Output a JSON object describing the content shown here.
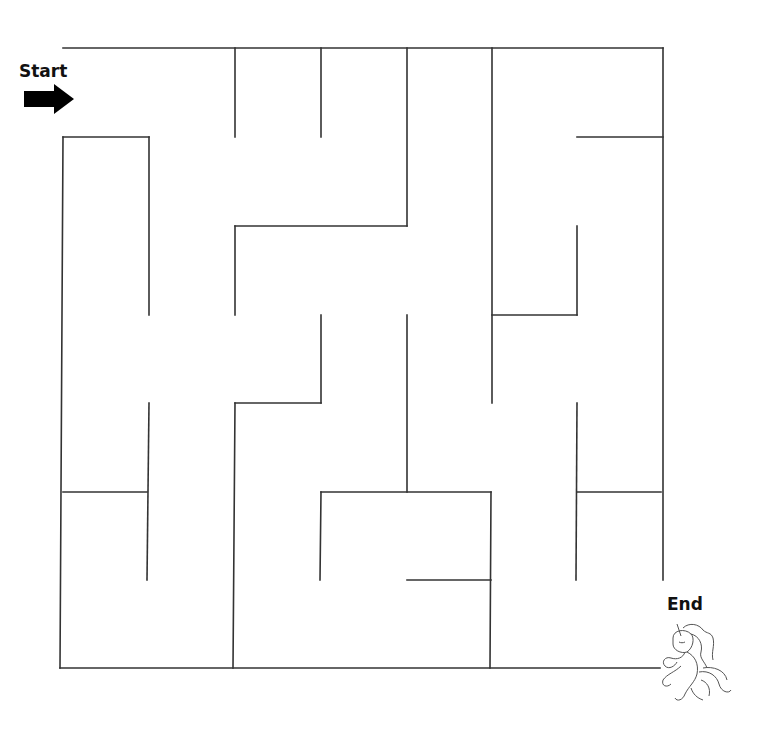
{
  "start": {
    "label": "Start",
    "icon": "arrow-right-icon"
  },
  "end": {
    "label": "End",
    "icon": "unicorn-icon"
  },
  "maze": {
    "stroke": "#333333",
    "walls": [
      [
        63,
        48,
        663,
        48
      ],
      [
        663,
        48,
        663,
        580
      ],
      [
        60,
        668,
        660,
        668
      ],
      [
        63,
        137,
        60,
        668
      ],
      [
        63,
        137,
        149,
        137
      ],
      [
        149,
        137,
        149,
        315
      ],
      [
        235,
        48,
        235,
        137
      ],
      [
        321,
        48,
        321,
        137
      ],
      [
        407,
        48,
        407,
        226
      ],
      [
        235,
        226,
        407,
        226
      ],
      [
        235,
        226,
        235,
        315
      ],
      [
        492,
        48,
        492,
        403
      ],
      [
        577,
        137,
        663,
        137
      ],
      [
        577,
        226,
        577,
        315
      ],
      [
        492,
        315,
        577,
        315
      ],
      [
        321,
        315,
        321,
        403
      ],
      [
        235,
        403,
        321,
        403
      ],
      [
        235,
        403,
        233,
        668
      ],
      [
        407,
        315,
        407,
        492
      ],
      [
        321,
        492,
        491,
        492
      ],
      [
        321,
        492,
        320,
        580
      ],
      [
        491,
        492,
        490,
        668
      ],
      [
        407,
        580,
        491,
        580
      ],
      [
        149,
        403,
        147,
        580
      ],
      [
        63,
        492,
        147,
        492
      ],
      [
        577,
        403,
        576,
        580
      ],
      [
        577,
        492,
        661,
        492
      ]
    ]
  }
}
